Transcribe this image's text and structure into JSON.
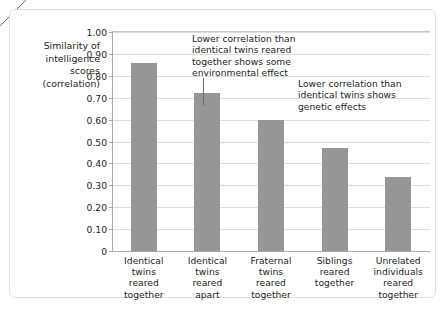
{
  "chart_data": {
    "type": "bar",
    "title": "",
    "subtitle": "",
    "xlabel": "",
    "ylabel": "Similarity of intelligence scores (correlation)",
    "ylabel_lines": [
      "Similarity of",
      "intelligence",
      "scores",
      "(correlation)"
    ],
    "categories": [
      "Identical twins reared together",
      "Identical twins reared apart",
      "Fraternal twins reared together",
      "Siblings reared together",
      "Unrelated individuals reared together"
    ],
    "category_lines": [
      [
        "Identical",
        "twins",
        "reared",
        "together"
      ],
      [
        "Identical",
        "twins",
        "reared",
        "apart"
      ],
      [
        "Fraternal",
        "twins",
        "reared",
        "together"
      ],
      [
        "Siblings",
        "reared",
        "together"
      ],
      [
        "Unrelated",
        "individuals",
        "reared",
        "together"
      ]
    ],
    "values": [
      0.86,
      0.72,
      0.6,
      0.47,
      0.34
    ],
    "ylim": [
      0,
      1.0
    ],
    "ytick_values": [
      1.0,
      0.9,
      0.8,
      0.7,
      0.6,
      0.5,
      0.4,
      0.3,
      0.2,
      0.1,
      0
    ],
    "ytick_labels": [
      "1.00",
      "0.90",
      "0.80",
      "0.70",
      "0.60",
      "0.50",
      "0.40",
      "0.30",
      "0.20",
      "0.10",
      "0"
    ],
    "grid": true,
    "legend": false,
    "bar_color": "#969696",
    "grid_color": "#dddddd",
    "axis_color": "#aaaaaa",
    "text_color": "#231f20",
    "annotations": [
      {
        "id": "annotation-1",
        "lines": [
          "Lower correlation than",
          "identical twins reared",
          "together shows some",
          "environmental effect"
        ],
        "points_to_category": "Identical twins reared apart"
      },
      {
        "id": "annotation-2",
        "lines": [
          "Lower correlation than",
          "identical twins shows",
          "genetic effects"
        ],
        "points_to_category": "Fraternal twins reared together"
      }
    ]
  }
}
